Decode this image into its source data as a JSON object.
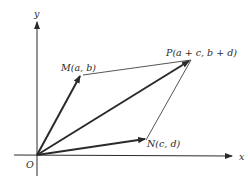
{
  "diagram": {
    "axes": {
      "x_label": "x",
      "y_label": "y",
      "origin_label": "O"
    },
    "points": {
      "M": {
        "label": "M(a, b)"
      },
      "N": {
        "label": "N(c, d)"
      },
      "P": {
        "label": "P(a + c, b + d)"
      }
    },
    "vectors": [
      {
        "name": "OM",
        "from": "O",
        "to": "M",
        "style": "bold-arrow"
      },
      {
        "name": "ON",
        "from": "O",
        "to": "N",
        "style": "bold-arrow"
      },
      {
        "name": "OP",
        "from": "O",
        "to": "P",
        "style": "bold-arrow"
      },
      {
        "name": "MP",
        "from": "M",
        "to": "P",
        "style": "thin-line"
      },
      {
        "name": "NP",
        "from": "N",
        "to": "P",
        "style": "thin-line"
      }
    ],
    "colors": {
      "stroke": "#2a2a2a",
      "background": "#ffffff"
    }
  }
}
